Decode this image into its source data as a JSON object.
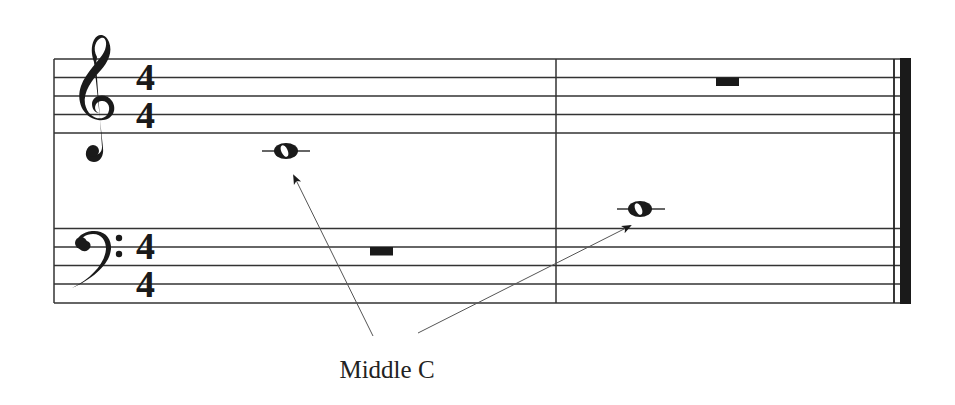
{
  "diagram": {
    "annotation_label": "Middle C",
    "colors": {
      "ink": "#1a1a1a",
      "staff_line": "#333333",
      "arrow": "#555555",
      "background": "#ffffff"
    },
    "treble_staff": {
      "clef": "treble-clef",
      "time_signature": {
        "top": "4",
        "bottom": "4"
      },
      "measures": [
        {
          "content": "whole note",
          "pitch": "Middle C",
          "ledger_line": true
        },
        {
          "content": "whole rest"
        }
      ]
    },
    "bass_staff": {
      "clef": "bass-clef",
      "time_signature": {
        "top": "4",
        "bottom": "4"
      },
      "measures": [
        {
          "content": "whole rest"
        },
        {
          "content": "whole note",
          "pitch": "Middle C",
          "ledger_line": true
        }
      ]
    },
    "arrows": [
      {
        "from": "Middle C label",
        "to": "treble measure 1 note"
      },
      {
        "from": "Middle C label",
        "to": "bass measure 2 note"
      }
    ],
    "barlines": [
      "start",
      "measure-1-end",
      "final-double"
    ]
  }
}
